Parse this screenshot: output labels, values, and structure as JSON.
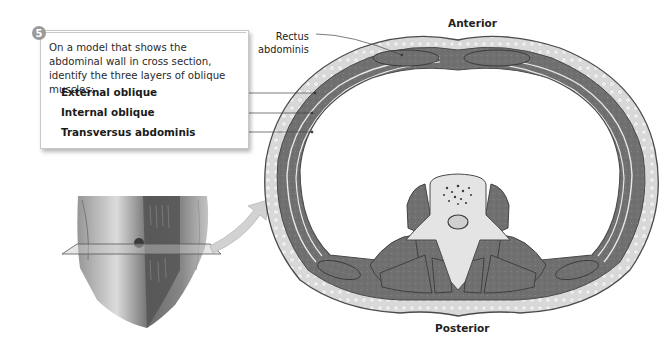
{
  "step": {
    "number": "5",
    "instruction": "On a model that shows the abdominal wall in cross section, identify the three layers of oblique muscles:"
  },
  "muscle_terms": [
    "External oblique",
    "Internal oblique",
    "Transversus abdominis"
  ],
  "cross_section_labels": {
    "anterior": "Anterior",
    "posterior": "Posterior",
    "rectus_line1": "Rectus",
    "rectus_line2": "abdominis"
  },
  "colors": {
    "muscle": "#6e6e6e",
    "fat": "#dcdcdc",
    "outline": "#4a4a4a",
    "bone": "#e4e4e4",
    "badge": "#9a9a9a",
    "arrow": "#d2d2d2"
  }
}
